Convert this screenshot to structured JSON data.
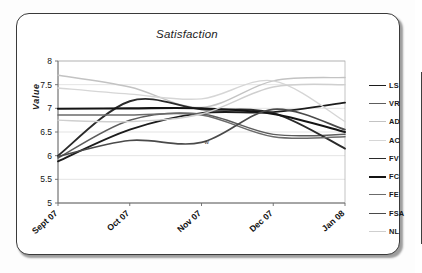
{
  "card": {
    "title": "Satisfaction",
    "border_color": "#3a3a3a",
    "background": "#ffffff"
  },
  "annotations": [
    {
      "text": "w",
      "x": "Nov 07",
      "y": 6.33
    }
  ],
  "legend_divider": {
    "name": "legend-divider",
    "color": "#3f3f3f"
  },
  "chart_data": {
    "type": "line",
    "title": "Satisfaction",
    "xlabel": "",
    "ylabel": "Value",
    "ylim": [
      5,
      8
    ],
    "ytick_values": [
      5,
      5.5,
      6,
      6.5,
      7,
      7.5,
      8
    ],
    "ytick_labels": [
      "5",
      "5.5",
      "6",
      "6.5",
      "7",
      "7.5",
      "8"
    ],
    "grid": true,
    "grid_axis": "y",
    "legend_position": "right",
    "categories": [
      "Sept 07",
      "Oct 07",
      "Nov 07",
      "Dec 07",
      "Jan 08"
    ],
    "x": [
      0,
      1,
      2,
      3,
      4
    ],
    "smoothing": "spline",
    "series": [
      {
        "name": "LS",
        "color": "#1c1c1c",
        "width": 1.9,
        "values": [
          5.88,
          6.55,
          6.9,
          6.92,
          7.12
        ]
      },
      {
        "name": "VR",
        "color": "#5d5d5d",
        "width": 1.5,
        "values": [
          5.95,
          6.75,
          6.88,
          6.45,
          6.45
        ]
      },
      {
        "name": "AD",
        "color": "#c3c3c3",
        "width": 1.4,
        "values": [
          7.7,
          7.45,
          7.02,
          7.58,
          7.65
        ]
      },
      {
        "name": "AC",
        "color": "#d6d6d6",
        "width": 1.4,
        "values": [
          7.43,
          7.3,
          7.2,
          7.58,
          6.72
        ]
      },
      {
        "name": "FV",
        "color": "#2a2a2a",
        "width": 1.9,
        "values": [
          6.0,
          7.15,
          6.98,
          6.9,
          6.15
        ]
      },
      {
        "name": "FC",
        "color": "#141414",
        "width": 2.1,
        "values": [
          6.99,
          7.0,
          7.0,
          6.88,
          6.5
        ]
      },
      {
        "name": "FE",
        "color": "#6b6b6b",
        "width": 1.5,
        "values": [
          6.86,
          6.86,
          6.86,
          6.4,
          6.4
        ]
      },
      {
        "name": "FSA",
        "color": "#4a4a4a",
        "width": 1.7,
        "values": [
          5.98,
          6.32,
          6.28,
          6.98,
          6.55
        ]
      },
      {
        "name": "NL",
        "color": "#cfcfcf",
        "width": 1.4,
        "values": [
          6.75,
          6.72,
          6.88,
          7.45,
          7.5
        ]
      }
    ]
  }
}
